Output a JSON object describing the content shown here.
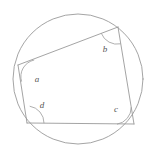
{
  "figure": {
    "kind": "cyclic-quadrilateral-in-circle",
    "caption": "",
    "canvas": {
      "width": 154,
      "height": 160,
      "background": "#ffffff"
    },
    "style": {
      "stroke_color": "#9a9a9a",
      "label_color": "#555555",
      "stroke_width": 0.9,
      "label_font_size": 9
    },
    "circle": {
      "label": "circumcircle",
      "cx": 78,
      "cy": 79,
      "r": 65
    },
    "vertices": [
      {
        "id": "A",
        "label": "left-vertex",
        "x": 18,
        "y": 65
      },
      {
        "id": "B",
        "label": "top-right-vertex",
        "x": 118,
        "y": 27
      },
      {
        "id": "C",
        "label": "bottom-right-vertex",
        "x": 134,
        "y": 124
      },
      {
        "id": "D",
        "label": "bottom-left-vertex",
        "x": 27,
        "y": 123
      }
    ],
    "edges": [
      {
        "id": "AB",
        "from": "A",
        "to": "B"
      },
      {
        "id": "BC",
        "from": "B",
        "to": "C"
      },
      {
        "id": "CD",
        "from": "C",
        "to": "D"
      },
      {
        "id": "DA",
        "from": "D",
        "to": "A"
      }
    ],
    "angles": [
      {
        "id": "a",
        "text": "a",
        "at_vertex": "A",
        "label_x": 37,
        "label_y": 80,
        "arc_radius": 17,
        "arc_path": "M 34.2 60.0 A 17 17 0 0 0 21.6 81.6"
      },
      {
        "id": "b",
        "text": "b",
        "at_vertex": "B",
        "label_x": 105,
        "label_y": 50,
        "arc_radius": 17,
        "arc_path": "M 101.3 33.3 A 17 17 0 0 0 120.7 43.8"
      },
      {
        "id": "c",
        "text": "c",
        "at_vertex": "C",
        "label_x": 116,
        "label_y": 110,
        "arc_radius": 17,
        "arc_path": "M 117.0 124.2 A 17 17 0 0 0 131.2 107.2"
      },
      {
        "id": "d",
        "text": "d",
        "at_vertex": "D",
        "label_x": 42,
        "label_y": 106,
        "arc_radius": 17,
        "arc_path": "M 29.7 106.2 A 17 17 0 0 1 44.0 123.2"
      }
    ]
  }
}
